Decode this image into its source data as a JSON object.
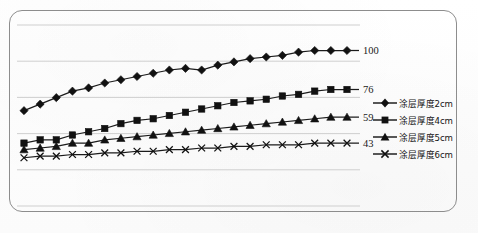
{
  "chart_data": {
    "type": "line",
    "title": "",
    "subtitle": "",
    "xlabel": "",
    "ylabel": "",
    "grid": true,
    "legend_position": "right",
    "xlim": [
      1,
      21
    ],
    "ylim": [
      0,
      120
    ],
    "gridlines_count": 6,
    "x": [
      1,
      2,
      3,
      4,
      5,
      6,
      7,
      8,
      9,
      10,
      11,
      12,
      13,
      14,
      15,
      16,
      17,
      18,
      19,
      20,
      21
    ],
    "end_labels": [
      "100",
      "76",
      "59",
      "43"
    ],
    "series": [
      {
        "name": "涂层厚度2cm",
        "marker": "diamond",
        "end_label": "100",
        "values": [
          63,
          67,
          71,
          75,
          77,
          80,
          82,
          84,
          86,
          88,
          89,
          88,
          91,
          93,
          95,
          96,
          97,
          99,
          100,
          100,
          100
        ]
      },
      {
        "name": "涂层厚度4cm",
        "marker": "square",
        "end_label": "76",
        "values": [
          43,
          45,
          45,
          48,
          50,
          52,
          55,
          57,
          58,
          60,
          62,
          64,
          66,
          68,
          69,
          70,
          72,
          73,
          75,
          76,
          76
        ]
      },
      {
        "name": "涂层厚度5cm",
        "marker": "triangle",
        "end_label": "59",
        "values": [
          39,
          40,
          41,
          43,
          43,
          45,
          46,
          47,
          48,
          49,
          50,
          51,
          52,
          53,
          54,
          55,
          56,
          57,
          58,
          59,
          59
        ]
      },
      {
        "name": "涂层厚度6cm",
        "marker": "x",
        "end_label": "43",
        "values": [
          34,
          35,
          35,
          36,
          36,
          37,
          37,
          38,
          38,
          39,
          39,
          40,
          40,
          41,
          41,
          42,
          42,
          42,
          43,
          43,
          43
        ]
      }
    ]
  },
  "legend": {
    "items": [
      {
        "label": "涂层厚度2cm",
        "marker": "diamond"
      },
      {
        "label": "涂层厚度4cm",
        "marker": "square"
      },
      {
        "label": "涂层厚度5cm",
        "marker": "triangle"
      },
      {
        "label": "涂层厚度6cm",
        "marker": "x"
      }
    ]
  },
  "axis_value_labels": [
    {
      "text": "100",
      "series": "涂层厚度2cm"
    },
    {
      "text": "76",
      "series": "涂层厚度4cm"
    },
    {
      "text": "59",
      "series": "涂层厚度5cm"
    },
    {
      "text": "43",
      "series": "涂层厚度6cm"
    }
  ],
  "colors": {
    "ink": "#1b1b1b",
    "grid": "#c9c9c9",
    "frame": "#8d8d8d",
    "background": "#ffffff"
  }
}
